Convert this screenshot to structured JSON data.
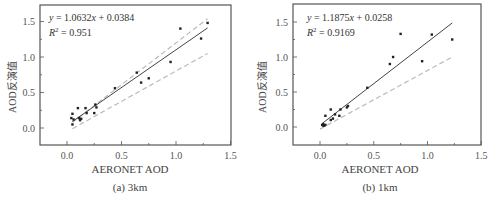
{
  "chart_data": [
    {
      "type": "scatter",
      "title": "",
      "caption": "(a) 3km",
      "xlabel": "AERONET AOD",
      "ylabel": "AOD反演值",
      "xlim": [
        -0.25,
        1.5
      ],
      "ylim": [
        -0.25,
        1.75
      ],
      "xticks": [
        "0.0",
        "0.5",
        "1.0",
        "1.5"
      ],
      "yticks": [
        "0.0",
        "0.5",
        "1.0",
        "1.5"
      ],
      "grid": false,
      "annotation": {
        "equation": "y = 1.0632x + 0.0384",
        "r2": "R² = 0.951"
      },
      "fit_line": {
        "slope": 1.0632,
        "intercept": 0.0384,
        "x_range": [
          0.05,
          1.29
        ]
      },
      "reference_lines": [
        {
          "name": "upper envelope",
          "style": "dashed",
          "points": [
            [
              0.05,
              0.08
            ],
            [
              1.29,
              1.54
            ]
          ]
        },
        {
          "name": "lower envelope",
          "style": "dashed",
          "points": [
            [
              0.05,
              -0.01
            ],
            [
              1.29,
              1.05
            ]
          ]
        }
      ],
      "points": [
        [
          0.04,
          0.14
        ],
        [
          0.05,
          0.05
        ],
        [
          0.05,
          0.2
        ],
        [
          0.06,
          0.12
        ],
        [
          0.1,
          0.28
        ],
        [
          0.11,
          0.14
        ],
        [
          0.12,
          0.11
        ],
        [
          0.13,
          0.13
        ],
        [
          0.17,
          0.28
        ],
        [
          0.18,
          0.21
        ],
        [
          0.25,
          0.21
        ],
        [
          0.26,
          0.33
        ],
        [
          0.27,
          0.29
        ],
        [
          0.44,
          0.56
        ],
        [
          0.64,
          0.78
        ],
        [
          0.68,
          0.64
        ],
        [
          0.75,
          0.7
        ],
        [
          0.95,
          0.93
        ],
        [
          1.04,
          1.4
        ],
        [
          1.23,
          1.26
        ],
        [
          1.29,
          1.48
        ]
      ]
    },
    {
      "type": "scatter",
      "title": "",
      "caption": "(b) 1km",
      "xlabel": "AERONET AOD",
      "ylabel": "AOD反演值",
      "xlim": [
        -0.25,
        1.5
      ],
      "ylim": [
        -0.25,
        1.75
      ],
      "xticks": [
        "0.0",
        "0.5",
        "1.0",
        "1.5"
      ],
      "yticks": [
        "0.0",
        "0.5",
        "1.0",
        "1.5"
      ],
      "grid": false,
      "annotation": {
        "equation": "y = 1.1875x + 0.0258",
        "r2": "R² = 0.9169"
      },
      "fit_line": {
        "slope": 1.1875,
        "intercept": 0.0258,
        "x_range": [
          0.02,
          1.23
        ]
      },
      "reference_lines": [
        {
          "name": "1:1 line",
          "style": "dashed",
          "points": [
            [
              0.0,
              -0.03
            ],
            [
              1.23,
              1.0
            ]
          ]
        }
      ],
      "points": [
        [
          0.02,
          0.03
        ],
        [
          0.03,
          0.02
        ],
        [
          0.03,
          0.04
        ],
        [
          0.04,
          0.02
        ],
        [
          0.05,
          0.03
        ],
        [
          0.05,
          0.16
        ],
        [
          0.1,
          0.25
        ],
        [
          0.1,
          0.1
        ],
        [
          0.12,
          0.12
        ],
        [
          0.14,
          0.18
        ],
        [
          0.18,
          0.16
        ],
        [
          0.19,
          0.25
        ],
        [
          0.25,
          0.28
        ],
        [
          0.26,
          0.3
        ],
        [
          0.44,
          0.56
        ],
        [
          0.65,
          0.9
        ],
        [
          0.68,
          1.0
        ],
        [
          0.75,
          1.33
        ],
        [
          0.95,
          0.94
        ],
        [
          1.04,
          1.32
        ],
        [
          1.23,
          1.25
        ]
      ]
    }
  ],
  "panels": [
    {
      "caption": "(a) 3km",
      "xlabel": "AERONET AOD",
      "ylabel": "AOD反演值",
      "equation_prefix": "y",
      "equation_body": " = 1.0632",
      "equation_x": "x",
      "equation_suffix": " + 0.0384",
      "r2_label": "R",
      "r2_value": " = 0.951"
    },
    {
      "caption": "(b) 1km",
      "xlabel": "AERONET AOD",
      "ylabel": "AOD反演值",
      "equation_prefix": "y",
      "equation_body": " = 1.1875",
      "equation_x": "x",
      "equation_suffix": " + 0.0258",
      "r2_label": "R",
      "r2_value": " = 0.9169"
    }
  ],
  "colors": {
    "axis": "#555555",
    "points": "#222222",
    "fit": "#444444",
    "dashed": "#bbbbbb"
  }
}
